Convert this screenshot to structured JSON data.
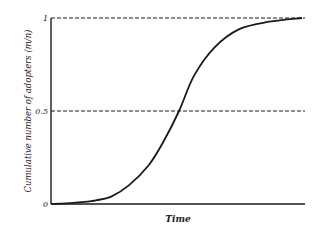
{
  "chart_data": {
    "type": "line",
    "title": "",
    "xlabel": "Time",
    "ylabel": "Cumulative number of adopters (m/n)",
    "xlim": [
      0,
      1
    ],
    "ylim": [
      0,
      1
    ],
    "y_ticks": [
      {
        "value": 0,
        "label": "0"
      },
      {
        "value": 0.5,
        "label": "0.5"
      },
      {
        "value": 1,
        "label": "1"
      }
    ],
    "x_ticks": [],
    "reference_lines": [
      {
        "value": 0.5,
        "style": "dashed"
      },
      {
        "value": 1,
        "style": "dashed"
      }
    ],
    "grid": false,
    "legend": "none",
    "series": [
      {
        "name": "Cumulative adopters",
        "x": [
          0,
          0.06,
          0.12,
          0.18,
          0.24,
          0.31,
          0.39,
          0.45,
          0.51,
          0.57,
          0.65,
          0.75,
          0.87,
          1.0
        ],
        "y": [
          0,
          0.003,
          0.01,
          0.02,
          0.04,
          0.1,
          0.21,
          0.34,
          0.5,
          0.69,
          0.84,
          0.94,
          0.98,
          1.0
        ]
      }
    ]
  }
}
